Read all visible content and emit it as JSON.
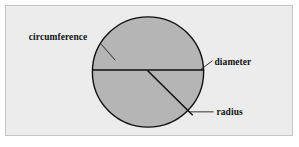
{
  "figure": {
    "type": "geometry-diagram",
    "background_color": "#ffffff",
    "panel": {
      "fill_color": "#ececed",
      "border_color": "#c6c6c8"
    },
    "circle": {
      "name": "circle",
      "fill_color": "#b5b5b5",
      "stroke_color": "#101010",
      "center_x": 143,
      "center_y": 67,
      "radius": 56
    },
    "lines": [
      {
        "name": "diameter-line",
        "x1": 87,
        "y1": 65,
        "x2": 199,
        "y2": 65,
        "stroke_color": "#101010"
      },
      {
        "name": "radius-line",
        "x1": 143,
        "y1": 66,
        "x2": 187,
        "y2": 110,
        "stroke_color": "#101010"
      }
    ],
    "labels": [
      {
        "id": "circumference",
        "text": "circumference",
        "text_x": 23,
        "text_y": 35,
        "anchor": "start",
        "leader": "M 96,39 L 109,54",
        "color": "#121212"
      },
      {
        "id": "diameter",
        "text": "diameter",
        "text_x": 209,
        "text_y": 61,
        "anchor": "start",
        "leader": "M 207,56 L 196,65",
        "color": "#121212"
      },
      {
        "id": "radius",
        "text": "radius",
        "text_x": 211,
        "text_y": 111,
        "anchor": "start",
        "leader": "M 209,108 L 185,108",
        "color": "#121212"
      }
    ]
  }
}
